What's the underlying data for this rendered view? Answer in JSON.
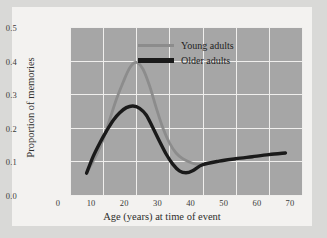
{
  "chart_data": {
    "type": "line",
    "title": "",
    "xlabel": "Age (years) at time of event",
    "ylabel": "Proportion of memories",
    "xlim": [
      0,
      70
    ],
    "ylim": [
      0.0,
      0.5
    ],
    "xticks": [
      "0",
      "10",
      "20",
      "30",
      "40",
      "50",
      "60",
      "70"
    ],
    "yticks": [
      "0.0",
      "0.1",
      "0.2",
      "0.3",
      "0.4",
      "0.5"
    ],
    "grid": true,
    "legend_position": "upper-right-inside",
    "plot_background": "#a6a6a6",
    "gridline_color": "#f0efed",
    "series": [
      {
        "name": "Young adults",
        "color": "#8c8c8c",
        "points": [
          {
            "x": 5,
            "y": 0.065
          },
          {
            "x": 8,
            "y": 0.12
          },
          {
            "x": 10,
            "y": 0.165
          },
          {
            "x": 12,
            "y": 0.225
          },
          {
            "x": 14,
            "y": 0.285
          },
          {
            "x": 16,
            "y": 0.335
          },
          {
            "x": 18,
            "y": 0.378
          },
          {
            "x": 20,
            "y": 0.395
          },
          {
            "x": 22,
            "y": 0.375
          },
          {
            "x": 24,
            "y": 0.325
          },
          {
            "x": 26,
            "y": 0.26
          },
          {
            "x": 28,
            "y": 0.2
          },
          {
            "x": 30,
            "y": 0.155
          },
          {
            "x": 32,
            "y": 0.125
          },
          {
            "x": 34,
            "y": 0.108
          },
          {
            "x": 36,
            "y": 0.098
          },
          {
            "x": 38,
            "y": 0.092
          },
          {
            "x": 40,
            "y": 0.09
          }
        ]
      },
      {
        "name": "Older adults",
        "color": "#1a1a1a",
        "points": [
          {
            "x": 5,
            "y": 0.065
          },
          {
            "x": 7,
            "y": 0.115
          },
          {
            "x": 9,
            "y": 0.155
          },
          {
            "x": 11,
            "y": 0.19
          },
          {
            "x": 13,
            "y": 0.222
          },
          {
            "x": 15,
            "y": 0.245
          },
          {
            "x": 17,
            "y": 0.26
          },
          {
            "x": 19,
            "y": 0.265
          },
          {
            "x": 21,
            "y": 0.258
          },
          {
            "x": 23,
            "y": 0.238
          },
          {
            "x": 25,
            "y": 0.2
          },
          {
            "x": 27,
            "y": 0.16
          },
          {
            "x": 29,
            "y": 0.122
          },
          {
            "x": 31,
            "y": 0.092
          },
          {
            "x": 33,
            "y": 0.072
          },
          {
            "x": 35,
            "y": 0.066
          },
          {
            "x": 37,
            "y": 0.072
          },
          {
            "x": 40,
            "y": 0.09
          },
          {
            "x": 45,
            "y": 0.101
          },
          {
            "x": 50,
            "y": 0.108
          },
          {
            "x": 55,
            "y": 0.114
          },
          {
            "x": 60,
            "y": 0.12
          },
          {
            "x": 65,
            "y": 0.125
          }
        ]
      }
    ]
  },
  "legend": {
    "items": [
      {
        "label": "Young adults",
        "color": "#8c8c8c"
      },
      {
        "label": "Older adults",
        "color": "#1a1a1a"
      }
    ]
  }
}
